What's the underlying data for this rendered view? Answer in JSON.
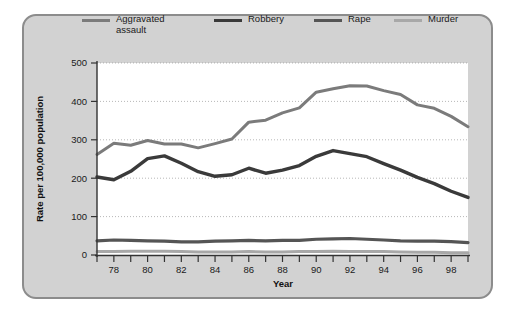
{
  "figure": {
    "panel_background": "#d2d2d2",
    "panel_border": "#8c8c8c",
    "plot_background": "#ffffff"
  },
  "legend": {
    "position": "top",
    "items": [
      {
        "label": "Aggravated\nassault",
        "color": "#7b7b7b",
        "width": 3.0
      },
      {
        "label": "Robbery",
        "color": "#3a3a3a",
        "width": 3.4
      },
      {
        "label": "Rape",
        "color": "#555555",
        "width": 3.2
      },
      {
        "label": "Murder",
        "color": "#a8a8a8",
        "width": 3.0
      }
    ]
  },
  "chart_data": {
    "type": "line",
    "title": "",
    "xlabel": "Year",
    "ylabel": "Rate per 100,000 population",
    "xlim": [
      77,
      99
    ],
    "ylim": [
      0,
      500
    ],
    "grid": true,
    "legend_position": "top",
    "x": [
      77,
      78,
      79,
      80,
      81,
      82,
      83,
      84,
      85,
      86,
      87,
      88,
      89,
      90,
      91,
      92,
      93,
      94,
      95,
      96,
      97,
      98,
      99
    ],
    "xticks": [
      77,
      78,
      79,
      80,
      81,
      82,
      83,
      84,
      85,
      86,
      87,
      88,
      89,
      90,
      91,
      92,
      93,
      94,
      95,
      96,
      97,
      98,
      99
    ],
    "xticklabels": [
      "",
      "78",
      "",
      "80",
      "",
      "82",
      "",
      "84",
      "",
      "86",
      "",
      "88",
      "",
      "90",
      "",
      "92",
      "",
      "94",
      "",
      "96",
      "",
      "98",
      ""
    ],
    "yticks": [
      0,
      100,
      200,
      300,
      400,
      500
    ],
    "yticklabels": [
      "0",
      "100",
      "200",
      "300",
      "400",
      "500"
    ],
    "series": [
      {
        "name": "Aggravated assault",
        "color": "#7b7b7b",
        "width": 3.0,
        "values": [
          262,
          291,
          286,
          298,
          289,
          289,
          279,
          290,
          302,
          346,
          351,
          370,
          383,
          424,
          433,
          441,
          440,
          428,
          418,
          391,
          382,
          361,
          334
        ]
      },
      {
        "name": "Robbery",
        "color": "#3a3a3a",
        "width": 3.4,
        "values": [
          203,
          196,
          218,
          251,
          258,
          239,
          217,
          205,
          209,
          226,
          213,
          221,
          233,
          257,
          272,
          264,
          256,
          238,
          221,
          202,
          186,
          166,
          150
        ]
      },
      {
        "name": "Rape",
        "color": "#555555",
        "width": 3.2,
        "values": [
          37,
          39,
          38,
          37,
          36,
          34,
          34,
          36,
          37,
          38,
          37,
          38,
          38,
          41,
          42,
          43,
          41,
          39,
          37,
          36,
          36,
          35,
          32
        ]
      },
      {
        "name": "Murder",
        "color": "#a8a8a8",
        "width": 3.0,
        "values": [
          9,
          9,
          10,
          10,
          10,
          9,
          8,
          8,
          8,
          9,
          8,
          8,
          9,
          9,
          10,
          9,
          9,
          9,
          8,
          7,
          7,
          6,
          6
        ]
      }
    ]
  },
  "artifact": {
    "bleed_text": ""
  }
}
